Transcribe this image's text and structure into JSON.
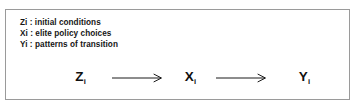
{
  "figure": {
    "border_color": "#9a9a9a",
    "background_color": "#ffffff",
    "text_color": "#161616"
  },
  "legend": {
    "separator": " : ",
    "items": [
      {
        "symbol": "Zi",
        "description": "initial conditions"
      },
      {
        "symbol": "Xi",
        "description": "elite policy choices"
      },
      {
        "symbol": "Yi",
        "description": "patterns of transition"
      }
    ]
  },
  "chain": {
    "nodes": [
      {
        "base": "Z",
        "subscript": "i"
      },
      {
        "base": "X",
        "subscript": "i"
      },
      {
        "base": "Y",
        "subscript": "i"
      }
    ],
    "arrows": [
      {
        "label": "arrow-z-to-x",
        "direction": "right"
      },
      {
        "label": "arrow-x-to-y",
        "direction": "right"
      }
    ]
  }
}
